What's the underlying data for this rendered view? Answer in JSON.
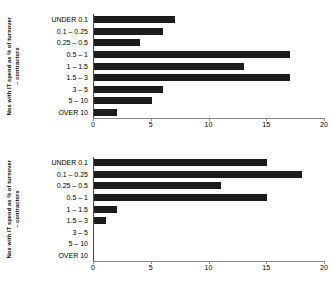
{
  "figure": {
    "background_color": "#ffffff",
    "bar_color": "#1c1c1c",
    "axis_color": "#8a8a8a"
  },
  "charts": [
    {
      "id": "chart-1",
      "axis_title_line1": "Nos with IT spend as % of turnover",
      "axis_title_line2": "– contractors",
      "chart_data": {
        "type": "bar",
        "orientation": "horizontal",
        "title": "",
        "xlabel": "",
        "ylabel": "Nos with IT spend as % of turnover – contractors",
        "categories": [
          "UNDER 0.1",
          "0.1 – 0.25",
          "0.25 – 0.5",
          "0.5 – 1",
          "1 – 1.5",
          "1.5 – 3",
          "3 – 5",
          "5 – 10",
          "OVER 10"
        ],
        "values": [
          7,
          6,
          4,
          17,
          13,
          17,
          6,
          5,
          2
        ],
        "xlim": [
          0,
          20
        ],
        "xticks": [
          0,
          5,
          10,
          15,
          20
        ],
        "xticklabels": [
          "0",
          "5",
          "10",
          "15",
          "20"
        ],
        "grid": false,
        "legend": false
      }
    },
    {
      "id": "chart-2",
      "axis_title_line1": "Nos with IT spend as % of turnover",
      "axis_title_line2": "– contractors",
      "chart_data": {
        "type": "bar",
        "orientation": "horizontal",
        "title": "",
        "xlabel": "",
        "ylabel": "Nos with IT spend as % of turnover – contractors",
        "categories": [
          "UNDER 0.1",
          "0.1 – 0.25",
          "0.25 – 0.5",
          "0.5 – 1",
          "1 – 1.5",
          "1.5 – 3",
          "3 – 5",
          "5 – 10",
          "OVER 10"
        ],
        "values": [
          15,
          18,
          11,
          15,
          2,
          1,
          0,
          0,
          0
        ],
        "xlim": [
          0,
          20
        ],
        "xticks": [
          0,
          5,
          10,
          15,
          20
        ],
        "xticklabels": [
          "0",
          "5",
          "10",
          "15",
          "20"
        ],
        "grid": false,
        "legend": false
      }
    }
  ]
}
